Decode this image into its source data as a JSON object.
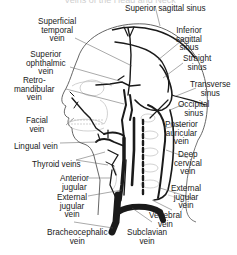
{
  "figure": {
    "title_partial": "Veins of the Head and Neck",
    "labels": {
      "superior_sagittal_sinus": "Superior sagittal sinus",
      "superficial_temporal_vein": [
        "Superficial",
        "temporal",
        "vein"
      ],
      "inferior_sagittal_sinus": [
        "Inferior",
        "sagittal",
        "sinus"
      ],
      "straight_sinus": [
        "Straight",
        "sinus"
      ],
      "superior_ophthalmic_vein": [
        "Superior",
        "ophthalmic",
        "vein"
      ],
      "retromandibular_vein": [
        "Retro-",
        "mandibular",
        "vein"
      ],
      "transverse_sinus": [
        "Transverse",
        "sinus"
      ],
      "occipital_sinus": [
        "Occipital",
        "sinus"
      ],
      "posterior_auricular_vein": [
        "Posterior",
        "auricular",
        "vein"
      ],
      "facial_vein": [
        "Facial",
        "vein"
      ],
      "lingual_vein": "Lingual vein",
      "deep_cervical_vein": [
        "Deep",
        "cervical",
        "vein"
      ],
      "thyroid_veins": "Thyroid veins",
      "anterior_jugular": [
        "Anterior",
        "jugular"
      ],
      "external_jugular_vein_right": [
        "External",
        "jugular",
        "vein"
      ],
      "external_jugular_vein_left": [
        "External",
        "jugular",
        "vein"
      ],
      "vertebral_vein": [
        "Vertebral",
        "vein"
      ],
      "brachiocephalic_vein": [
        "Bracheocephalic",
        "vein"
      ],
      "subclavian_vein": [
        "Subclavian",
        "vein"
      ]
    },
    "colors": {
      "vein": "#1a1a1a",
      "outline": "#444444",
      "bone": "#bdbdbd",
      "leader": "#555555",
      "text": "#1a1a1a"
    }
  }
}
